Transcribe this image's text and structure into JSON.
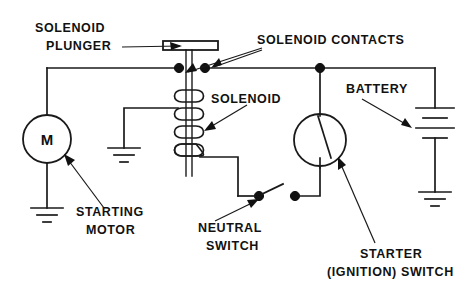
{
  "diagram": {
    "background_color": "#ffffff",
    "line_color": "#1a1a1a",
    "labels": {
      "solenoid_plunger_line1": "SOLENOID",
      "solenoid_plunger_line2": "PLUNGER",
      "solenoid_contacts": "SOLENOID CONTACTS",
      "solenoid": "SOLENOID",
      "battery": "BATTERY",
      "starting_motor_line1": "STARTING",
      "starting_motor_line2": "MOTOR",
      "neutral_switch_line1": "NEUTRAL",
      "neutral_switch_line2": "SWITCH",
      "starter_switch_line1": "STARTER",
      "starter_switch_line2": "(IGNITION) SWITCH",
      "motor_symbol": "M"
    },
    "components": [
      {
        "name": "solenoid-plunger",
        "type": "plunger-bar"
      },
      {
        "name": "solenoid-contacts",
        "type": "contact-pair",
        "count": 2
      },
      {
        "name": "solenoid-coil",
        "type": "coil",
        "turns": 4
      },
      {
        "name": "starting-motor",
        "type": "motor",
        "symbol": "M"
      },
      {
        "name": "battery",
        "type": "battery",
        "cells": 2
      },
      {
        "name": "starter-ignition-switch",
        "type": "rotary-switch"
      },
      {
        "name": "neutral-switch",
        "type": "open-switch"
      },
      {
        "name": "ground-motor",
        "type": "ground"
      },
      {
        "name": "ground-solenoid",
        "type": "ground"
      },
      {
        "name": "ground-battery",
        "type": "ground"
      }
    ]
  }
}
